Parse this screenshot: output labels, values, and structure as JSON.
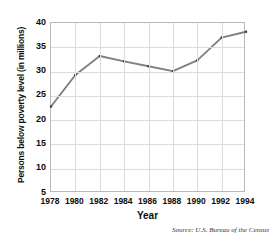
{
  "chart_data": {
    "type": "line",
    "title": "",
    "xlabel": "Year",
    "ylabel": "Persons below poverty level (in millions)",
    "source": "Source: U.S. Bureau of the Census",
    "x": [
      1978,
      1980,
      1982,
      1984,
      1986,
      1988,
      1990,
      1992,
      1994
    ],
    "values": [
      22.8,
      29.3,
      33.2,
      32.1,
      31.1,
      30.1,
      32.3,
      37.0,
      38.2
    ],
    "xtick_labels": [
      "1978",
      "1980",
      "1982",
      "1984",
      "1986",
      "1988",
      "1990",
      "1992",
      "1994"
    ],
    "ytick_labels": [
      "40",
      "35",
      "30",
      "25",
      "20",
      "15",
      "10",
      "5"
    ],
    "yticks": [
      40,
      35,
      30,
      25,
      20,
      15,
      10,
      5
    ],
    "xlim": [
      1978,
      1994
    ],
    "ylim": [
      5,
      40
    ],
    "grid": true,
    "legend": "none",
    "line_color": "#808080",
    "marker_color": "#3f3f3f",
    "grid_color": "#dcdcdc",
    "frame_color": "#b9b9b9",
    "text_color": "#0d0d0d"
  },
  "ylabel_parts": {
    "main": "Persons below poverty level ",
    "unit": "(in millions)"
  }
}
